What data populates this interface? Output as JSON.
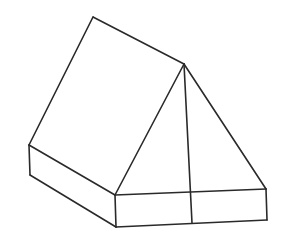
{
  "figure": {
    "background": "#ffffff",
    "stroke_color": "#2a2a2a",
    "stroke_width": 1.6
  },
  "vertices": {
    "ridge_back": [
      93,
      17
    ],
    "apex": [
      184,
      64
    ],
    "left_eave": [
      29,
      145
    ],
    "left_bottom": [
      30,
      175
    ],
    "front_left_top": [
      115,
      195
    ],
    "front_left_bottom": [
      116,
      227
    ],
    "right_top": [
      266,
      189
    ],
    "right_bottom": [
      267,
      220
    ],
    "pole_top": [
      191,
      192
    ],
    "pole_bottom": [
      192,
      223
    ]
  },
  "edges": [
    {
      "name": "roof-ridge-line",
      "from": "ridge_back",
      "to": "apex"
    },
    {
      "name": "roof-left-eave-line",
      "from": "ridge_back",
      "to": "left_eave"
    },
    {
      "name": "roof-bottom-edge-line",
      "from": "left_eave",
      "to": "front_left_top"
    },
    {
      "name": "front-left-slope-line",
      "from": "apex",
      "to": "front_left_top"
    },
    {
      "name": "front-right-slope-line",
      "from": "apex",
      "to": "right_top"
    },
    {
      "name": "center-pole-line",
      "from": "apex",
      "to": "pole_bottom"
    },
    {
      "name": "base-left-vertical-line",
      "from": "left_eave",
      "to": "left_bottom"
    },
    {
      "name": "base-side-bottom-line",
      "from": "left_bottom",
      "to": "front_left_bottom"
    },
    {
      "name": "base-front-left-vertical-line",
      "from": "front_left_top",
      "to": "front_left_bottom"
    },
    {
      "name": "base-front-top-line",
      "from": "front_left_top",
      "to": "right_top"
    },
    {
      "name": "base-front-bottom-line",
      "from": "front_left_bottom",
      "to": "right_bottom"
    },
    {
      "name": "base-right-vertical-line",
      "from": "right_top",
      "to": "right_bottom"
    }
  ]
}
